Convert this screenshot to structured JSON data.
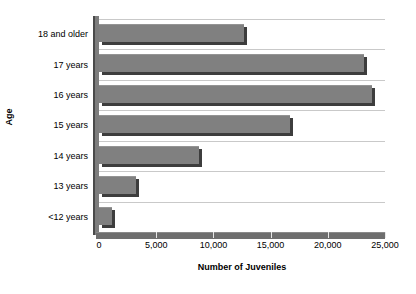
{
  "chart_data": {
    "type": "bar",
    "orientation": "horizontal",
    "title": "",
    "xlabel": "Number of Juveniles",
    "ylabel": "Age",
    "categories": [
      "<12 years",
      "13 years",
      "14 years",
      "15 years",
      "16 years",
      "17 years",
      "18 and older"
    ],
    "values": [
      1100,
      3200,
      8700,
      16700,
      23900,
      23200,
      12700
    ],
    "xlim": [
      0,
      25000
    ],
    "xticks": [
      0,
      5000,
      10000,
      15000,
      20000,
      25000
    ],
    "xtick_labels": [
      "0",
      "5,000",
      "10,000",
      "15,000",
      "20,000",
      "25,000"
    ],
    "grid": "horizontal",
    "legend": "none",
    "bar_color": "#808080",
    "bar_shadow_color": "#3d3d3d",
    "gridline_color": "#c9c9c9",
    "axis_color": "#6e6e6e",
    "background_color": "#ffffff"
  },
  "axes": {
    "y_title": "Age",
    "x_title": "Number of Juveniles"
  },
  "y_tick_labels": [
    "18 and older",
    "17 years",
    "16 years",
    "15 years",
    "14 years",
    "13 years",
    "<12 years"
  ]
}
